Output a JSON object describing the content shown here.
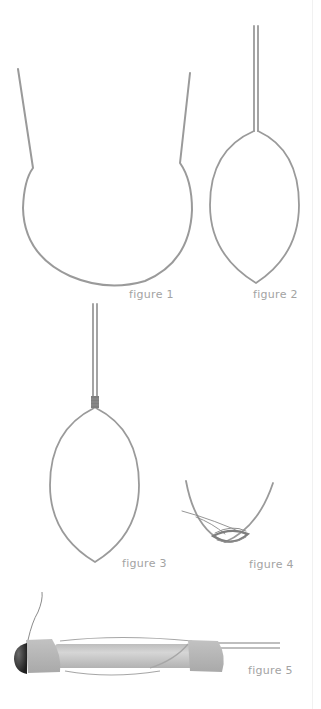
{
  "diagram": {
    "colors": {
      "background": "#ffffff",
      "wire": "#9a9a9a",
      "label": "#a3a3a3",
      "band": "#b4b4b4",
      "tube": "#c9c9c9",
      "tip": "#2e2e2e"
    },
    "figures": [
      {
        "id": 1,
        "label": "figure 1",
        "description": "open wire loop with two splayed ends"
      },
      {
        "id": 2,
        "label": "figure 2",
        "description": "leaf-shaped loop with twin parallel wires"
      },
      {
        "id": 3,
        "label": "figure 3",
        "description": "leaf-shaped loop with wrapped band at neck"
      },
      {
        "id": 4,
        "label": "figure 4",
        "description": "close-up of loop tip with thread wrapping"
      },
      {
        "id": 5,
        "label": "figure 5",
        "description": "assembled tube with two wrapped bands and dark tip"
      }
    ]
  }
}
